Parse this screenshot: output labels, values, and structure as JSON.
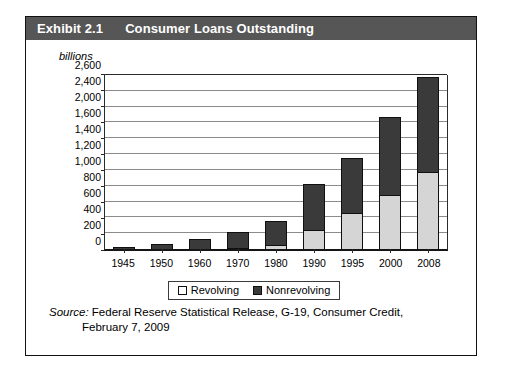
{
  "exhibit": {
    "number": "Exhibit 2.1",
    "title": "Consumer Loans Outstanding",
    "units_label": "billions"
  },
  "legend": {
    "revolving": "Revolving",
    "nonrevolving": "Nonrevolving"
  },
  "source": {
    "label": "Source:",
    "line1": " Federal Reserve Statistical Release, G-19, Consumer Credit,",
    "line2": "February 7, 2009"
  },
  "colors": {
    "title_bar": "#565656",
    "revolving": "#d5d5d5",
    "nonrevolving": "#3a3a3a",
    "gridline": "#8b8b8b",
    "axis": "#151515"
  },
  "chart_data": {
    "type": "bar",
    "title": "Consumer Loans Outstanding",
    "subtitle": "",
    "xlabel": "",
    "ylabel": "billions",
    "stacked": true,
    "grid": true,
    "legend_position": "bottom",
    "ylim": [
      0,
      2600
    ],
    "yticks": [
      0,
      200,
      400,
      600,
      800,
      1000,
      1200,
      1400,
      1600,
      2000,
      2400,
      2600
    ],
    "ytick_labels": [
      "0",
      "200",
      "400",
      "600",
      "800",
      "1,000",
      "1,200",
      "1,400",
      "1,600",
      "2,000",
      "2,400",
      "2,600"
    ],
    "categories": [
      "1945",
      "1950",
      "1960",
      "1970",
      "1980",
      "1990",
      "1995",
      "2000",
      "2008"
    ],
    "series": [
      {
        "name": "Revolving",
        "values": [
          0,
          0,
          0,
          5,
          55,
          240,
          450,
          680,
          960
        ]
      },
      {
        "name": "Nonrevolving",
        "values": [
          20,
          65,
          130,
          200,
          300,
          570,
          690,
          1020,
          1590
        ]
      }
    ],
    "totals": [
      20,
      65,
      130,
      205,
      355,
      810,
      1140,
      1700,
      2550
    ]
  }
}
